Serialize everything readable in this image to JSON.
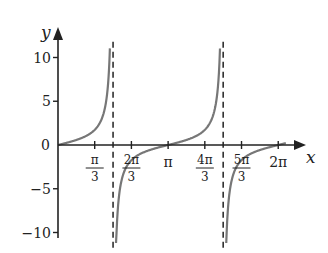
{
  "chart_data": {
    "type": "line",
    "title": "",
    "function": "y = tan x",
    "xlabel": "x",
    "ylabel": "y",
    "xlim": [
      0,
      6.5
    ],
    "ylim": [
      -11.5,
      11.5
    ],
    "grid": false,
    "legend": null,
    "x_ticks": [
      {
        "value": 1.0472,
        "num": "π",
        "den": "3"
      },
      {
        "value": 2.0944,
        "num": "2π",
        "den": "3"
      },
      {
        "value": 3.1416,
        "label": "π"
      },
      {
        "value": 4.1888,
        "num": "4π",
        "den": "3"
      },
      {
        "value": 5.236,
        "num": "5π",
        "den": "3"
      },
      {
        "value": 6.2832,
        "label": "2π"
      }
    ],
    "y_ticks": [
      {
        "value": 10,
        "label": "10"
      },
      {
        "value": 5,
        "label": "5"
      },
      {
        "value": 0,
        "label": "0"
      },
      {
        "value": -5,
        "label": "−5"
      },
      {
        "value": -10,
        "label": "−10"
      }
    ],
    "asymptotes": [
      1.5708,
      4.7124
    ],
    "series": [
      {
        "name": "tan x",
        "color": "#777777",
        "segments": [
          {
            "x": [
              0,
              0.5236,
              0.7854,
              1.0472,
              1.2,
              1.3,
              1.4,
              1.471
            ],
            "y": [
              0,
              0.577,
              1.0,
              1.732,
              2.57,
              3.6,
              5.8,
              10.0
            ]
          },
          {
            "x": [
              1.66,
              1.75,
              2.0944,
              2.618,
              3.1416,
              3.665,
              3.927,
              4.1888,
              4.4,
              4.5,
              4.612
            ],
            "y": [
              -11.0,
              -5.5,
              -1.732,
              -0.577,
              0,
              0.577,
              1.0,
              1.732,
              3.08,
              4.64,
              10.0
            ]
          },
          {
            "x": [
              4.8,
              4.9,
              5.236,
              5.76,
              6.2832,
              6.5
            ],
            "y": [
              -11.0,
              -5.2,
              -1.732,
              -0.577,
              0,
              0.22
            ]
          }
        ]
      }
    ],
    "colors": {
      "axis": "#222222",
      "curve": "#777777",
      "asymptote": "#222222"
    }
  }
}
